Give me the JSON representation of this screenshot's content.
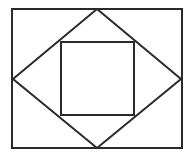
{
  "diagram": {
    "stroke_color": "#2a2a2a",
    "background": "#ffffff",
    "stroke_width": 2,
    "outer_rectangle": {
      "x": 12,
      "y": 9,
      "width": 170,
      "height": 139
    },
    "diamond": {
      "points": [
        [
          97,
          9
        ],
        [
          181,
          79
        ],
        [
          97,
          148
        ],
        [
          13,
          79
        ]
      ]
    },
    "inner_square": {
      "x": 61,
      "y": 42,
      "width": 73,
      "height": 73
    }
  }
}
